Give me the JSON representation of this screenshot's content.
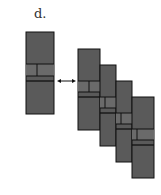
{
  "panel_label": "d.",
  "colors": {
    "fill": "#5a5a5a",
    "band": "#6a6a6a",
    "stroke": "#111111",
    "arrow": "#111111"
  },
  "single_block": {
    "x": 26,
    "y": 32,
    "w": 28,
    "h": 82,
    "band_top": 64,
    "band_mid": 76,
    "band_bot": 81,
    "divider_x": 37
  },
  "arrow": {
    "x1": 57,
    "x2": 76,
    "y": 81,
    "style": "double-headed"
  },
  "stack_blocks": [
    {
      "x": 78,
      "y": 49,
      "w": 22,
      "h": 81,
      "band_top": 81,
      "band_mid": 92,
      "band_bot": 97,
      "divider_x": 89
    },
    {
      "x": 100,
      "y": 65,
      "w": 16,
      "h": 81,
      "band_top": 97,
      "band_mid": 108,
      "band_bot": 113,
      "divider_x": 105
    },
    {
      "x": 116,
      "y": 81,
      "w": 16,
      "h": 81,
      "band_top": 113,
      "band_mid": 124,
      "band_bot": 129,
      "divider_x": 121
    },
    {
      "x": 132,
      "y": 97,
      "w": 22,
      "h": 81,
      "band_top": 129,
      "band_mid": 140,
      "band_bot": 145,
      "divider_x": 137
    }
  ]
}
